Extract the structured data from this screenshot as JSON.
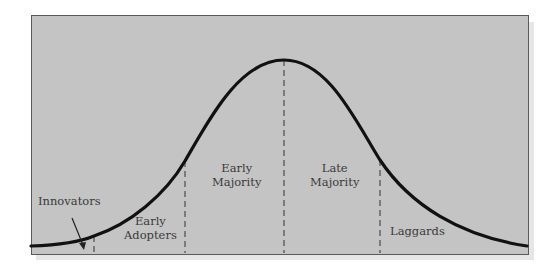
{
  "diagram": {
    "type": "bell-curve",
    "colors": {
      "background": "#c4c4c4",
      "curve": "#111111",
      "dash": "#555555",
      "text": "#3a3a3a",
      "border": "#5a5a5a"
    },
    "segments": [
      {
        "id": "innovators",
        "lines": [
          "Innovators"
        ]
      },
      {
        "id": "early-adopters",
        "lines": [
          "Early",
          "Adopters"
        ]
      },
      {
        "id": "early-majority",
        "lines": [
          "Early",
          "Majority"
        ]
      },
      {
        "id": "late-majority",
        "lines": [
          "Late",
          "Majority"
        ]
      },
      {
        "id": "laggards",
        "lines": [
          "Laggards"
        ]
      }
    ]
  },
  "labels": {
    "innovators": {
      "l1": "Innovators"
    },
    "early_adopters": {
      "l1": "Early",
      "l2": "Adopters"
    },
    "early_majority": {
      "l1": "Early",
      "l2": "Majority"
    },
    "late_majority": {
      "l1": "Late",
      "l2": "Majority"
    },
    "laggards": {
      "l1": "Laggards"
    }
  }
}
